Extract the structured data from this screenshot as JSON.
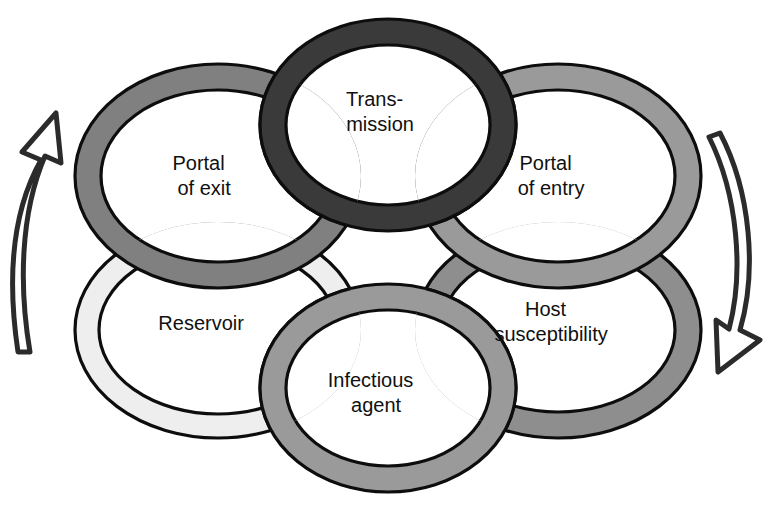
{
  "diagram": {
    "background_color": "#ffffff",
    "outline_color": "#0d0d0d",
    "rings": [
      {
        "id": "portal-of-exit",
        "label_line1": "Portal",
        "label_line2": "of exit",
        "fill_color": "#808080",
        "position": "top-left",
        "cx": 218,
        "cy": 176,
        "rx": 143,
        "ry": 112,
        "band": 26
      },
      {
        "id": "transmission",
        "label_line1": "Trans-",
        "label_line2": "mission",
        "fill_color": "#3a3a3a",
        "position": "top-center",
        "cx": 388,
        "cy": 125,
        "rx": 128,
        "ry": 106,
        "band": 26
      },
      {
        "id": "portal-of-entry",
        "label_line1": "Portal",
        "label_line2": "of entry",
        "fill_color": "#9a9a9a",
        "position": "top-right",
        "cx": 558,
        "cy": 176,
        "rx": 143,
        "ry": 112,
        "band": 26
      },
      {
        "id": "reservoir",
        "label_line1": "Reservoir",
        "label_line2": "",
        "fill_color": "#eeeeee",
        "position": "bottom-left",
        "cx": 218,
        "cy": 330,
        "rx": 143,
        "ry": 108,
        "band": 24
      },
      {
        "id": "infectious-agent",
        "label_line1": "Infectious",
        "label_line2": "agent",
        "fill_color": "#9a9a9a",
        "position": "bottom-center",
        "cx": 388,
        "cy": 388,
        "rx": 128,
        "ry": 104,
        "band": 26
      },
      {
        "id": "host-susceptibility",
        "label_line1": "Host",
        "label_line2": "susceptibility",
        "fill_color": "#8e8e8e",
        "position": "bottom-right",
        "cx": 558,
        "cy": 330,
        "rx": 143,
        "ry": 108,
        "band": 26
      }
    ],
    "arrows": [
      {
        "id": "left-arrow",
        "direction": "up",
        "style": "outline",
        "stroke_color": "#2b2b2b",
        "side": "left"
      },
      {
        "id": "right-arrow",
        "direction": "down",
        "style": "outline",
        "stroke_color": "#2b2b2b",
        "side": "right"
      }
    ]
  }
}
